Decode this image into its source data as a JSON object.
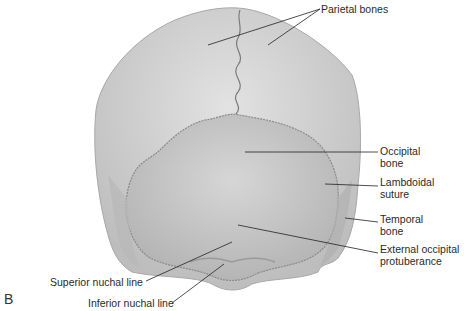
{
  "figure": {
    "panel_letter": "B",
    "colors": {
      "bone_light": "#d9d9d9",
      "bone_mid": "#c4c4c4",
      "occipital": "#cdcdcd",
      "suture": "#7a7a7a",
      "leader_line": "#222222",
      "text": "#2a2a2a"
    },
    "labels": [
      {
        "id": "parietal",
        "text": "Parietal bones"
      },
      {
        "id": "occipital",
        "text": "Occipital\nbone"
      },
      {
        "id": "lambdoidal",
        "text": "Lambdoidal\nsuture"
      },
      {
        "id": "temporal",
        "text": "Temporal\nbone"
      },
      {
        "id": "ext_occ",
        "text": "External occipital\nprotuberance"
      },
      {
        "id": "sup_nuchal",
        "text": "Superior nuchal line"
      },
      {
        "id": "inf_nuchal",
        "text": "Inferior nuchal line"
      }
    ]
  }
}
